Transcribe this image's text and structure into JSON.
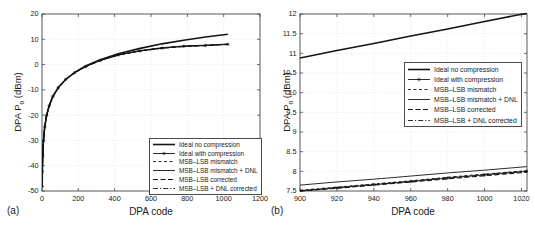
{
  "figure": {
    "background": "#ffffff",
    "panel_a_tag": "(a)",
    "panel_b_tag": "(b)"
  },
  "colors": {
    "line": "#141414",
    "frame": "#4a4a4a",
    "grid": "#dcdcdc",
    "text": "#1a1a1a"
  },
  "chart_data": [
    {
      "type": "line",
      "panel": "a",
      "title": "",
      "xlabel": "DPA code",
      "ylabel": "DPA P_o (dBm)",
      "ylabel_parts": {
        "pre": "DPA P",
        "sub": "o",
        "post": " (dBm)"
      },
      "xlim": [
        0,
        1200
      ],
      "ylim": [
        -50,
        20
      ],
      "xticks": [
        0,
        200,
        400,
        600,
        800,
        1000,
        1200
      ],
      "yticks": [
        -50,
        -40,
        -30,
        -20,
        -10,
        0,
        10,
        20
      ],
      "grid": true,
      "legend_position": "bottom-right",
      "x": [
        1,
        2,
        4,
        8,
        15,
        25,
        40,
        60,
        90,
        130,
        180,
        240,
        320,
        420,
        540,
        660,
        780,
        900,
        1023
      ],
      "series": [
        {
          "name": "Ideal no compression",
          "style": "solid-thick",
          "values": [
            -48.2,
            -42.2,
            -36.2,
            -30.2,
            -24.7,
            -20.2,
            -16.2,
            -12.6,
            -9.1,
            -5.9,
            -3.1,
            -0.6,
            1.9,
            4.3,
            6.4,
            8.2,
            9.6,
            10.9,
            12.0
          ]
        },
        {
          "name": "Ideal with compression",
          "style": "solid-star",
          "values": [
            -48.2,
            -42.2,
            -36.2,
            -30.2,
            -24.7,
            -20.2,
            -16.2,
            -12.6,
            -9.1,
            -5.9,
            -3.2,
            -0.8,
            1.6,
            3.8,
            5.4,
            6.5,
            7.2,
            7.55,
            8.0
          ]
        },
        {
          "name": "MSB–LSB mismatch",
          "style": "dashed",
          "values": [
            -48.2,
            -42.2,
            -36.2,
            -30.2,
            -24.7,
            -20.2,
            -16.2,
            -12.6,
            -9.1,
            -5.9,
            -3.18,
            -0.78,
            1.62,
            3.82,
            5.43,
            6.53,
            7.23,
            7.57,
            8.02
          ]
        },
        {
          "name": "MSB–LSB mismatch + DNL",
          "style": "solid-thin",
          "values": [
            -48.2,
            -42.2,
            -36.2,
            -30.2,
            -24.7,
            -20.2,
            -16.2,
            -12.6,
            -9.1,
            -5.88,
            -3.15,
            -0.72,
            1.7,
            3.92,
            5.55,
            6.68,
            7.36,
            7.68,
            8.12
          ]
        },
        {
          "name": "MSB–LSB corrected",
          "style": "dashed-long",
          "values": [
            -48.2,
            -42.2,
            -36.2,
            -30.2,
            -24.7,
            -20.2,
            -16.2,
            -12.6,
            -9.1,
            -5.9,
            -3.22,
            -0.82,
            1.58,
            3.78,
            5.38,
            6.48,
            7.18,
            7.52,
            7.98
          ]
        },
        {
          "name": "MSB–LSB + DNL corrected",
          "style": "dashdot",
          "values": [
            -48.2,
            -42.2,
            -36.2,
            -30.2,
            -24.7,
            -20.2,
            -16.2,
            -12.6,
            -9.1,
            -5.9,
            -3.19,
            -0.79,
            1.61,
            3.81,
            5.41,
            6.51,
            7.21,
            7.54,
            8.0
          ]
        }
      ]
    },
    {
      "type": "line",
      "panel": "b",
      "title": "",
      "xlabel": "DPA code",
      "ylabel": "DPA P_o (dBm)",
      "ylabel_parts": {
        "pre": "DPA P",
        "sub": "o",
        "post": " (dBm)"
      },
      "xlim": [
        900,
        1023
      ],
      "ylim": [
        7.5,
        12
      ],
      "xticks": [
        900,
        920,
        940,
        960,
        980,
        1000,
        1020
      ],
      "yticks": [
        7.5,
        8,
        8.5,
        9,
        9.5,
        10,
        10.5,
        11,
        11.5,
        12
      ],
      "grid": true,
      "legend_position": "middle-right",
      "x": [
        900,
        920,
        940,
        960,
        980,
        1000,
        1023
      ],
      "series": [
        {
          "name": "Ideal no compression",
          "style": "solid-thick",
          "values": [
            10.88,
            11.07,
            11.25,
            11.44,
            11.62,
            11.81,
            12.02
          ]
        },
        {
          "name": "Ideal with compression",
          "style": "solid-star",
          "values": [
            7.5,
            7.58,
            7.66,
            7.74,
            7.83,
            7.91,
            8.0
          ]
        },
        {
          "name": "MSB–LSB mismatch",
          "style": "dashed",
          "values": [
            7.52,
            7.6,
            7.68,
            7.76,
            7.85,
            7.93,
            8.02
          ]
        },
        {
          "name": "MSB–LSB mismatch + DNL",
          "style": "solid-thin",
          "values": [
            7.65,
            7.73,
            7.8,
            7.88,
            7.96,
            8.03,
            8.12
          ]
        },
        {
          "name": "MSB–LSB corrected",
          "style": "dashed-long",
          "values": [
            7.5,
            7.57,
            7.65,
            7.73,
            7.81,
            7.89,
            7.98
          ]
        },
        {
          "name": "MSB–LSB + DNL corrected",
          "style": "dashdot",
          "values": [
            7.51,
            7.59,
            7.67,
            7.75,
            7.84,
            7.92,
            8.01
          ]
        }
      ]
    }
  ]
}
